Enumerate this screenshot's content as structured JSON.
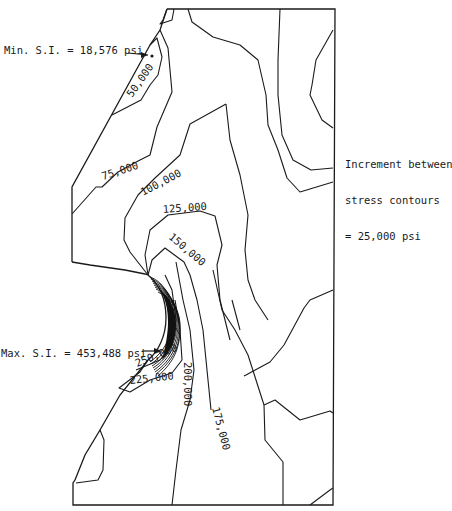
{
  "figure": {
    "type": "stress-intensity-contour-plot",
    "min_annotation": "Min. S.I. = 18,576 psi",
    "max_annotation": "Max. S.I. = 453,488 psi",
    "increment_note": {
      "line1": "Increment between",
      "line2": "stress contours",
      "line3": "= 25,000 psi"
    },
    "contour_labels": {
      "c50k": "50,000",
      "c75k": "75,000",
      "c100k": "100,000",
      "c125k": "125,000",
      "c150k": "150,000",
      "c175k": "175,000",
      "c200k": "200,000",
      "c225k": "225,000",
      "c250k": "250,000"
    },
    "line_color": "#1a1a1a",
    "background": "#ffffff"
  }
}
